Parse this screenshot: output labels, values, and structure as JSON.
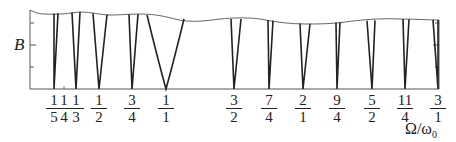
{
  "chart_data": {
    "type": "diagram",
    "title": "",
    "ylabel": "B",
    "xlabel": "Ω/ω₀",
    "y_ticks_count": 3,
    "tongues": [
      {
        "label_num": "1",
        "label_den": "5",
        "value": 0.2,
        "x": 54,
        "left_top": 54,
        "right_top": 58
      },
      {
        "label_num": "1",
        "label_den": "4",
        "value": 0.25,
        "x": 64,
        "left_top": 64,
        "right_top": 64
      },
      {
        "label_num": "1",
        "label_den": "3",
        "value": 0.333,
        "x": 76,
        "left_top": 72,
        "right_top": 80
      },
      {
        "label_num": "1",
        "label_den": "2",
        "value": 0.5,
        "x": 99,
        "left_top": 93,
        "right_top": 107
      },
      {
        "label_num": "3",
        "label_den": "4",
        "value": 0.75,
        "x": 132,
        "left_top": 129,
        "right_top": 138
      },
      {
        "label_num": "1",
        "label_den": "1",
        "value": 1.0,
        "x": 166,
        "left_top": 147,
        "right_top": 184
      },
      {
        "label_num": "3",
        "label_den": "2",
        "value": 1.5,
        "x": 234,
        "left_top": 231,
        "right_top": 241
      },
      {
        "label_num": "7",
        "label_den": "4",
        "value": 1.75,
        "x": 269,
        "left_top": 268,
        "right_top": 273
      },
      {
        "label_num": "2",
        "label_den": "1",
        "value": 2.0,
        "x": 303,
        "left_top": 300,
        "right_top": 310
      },
      {
        "label_num": "9",
        "label_den": "4",
        "value": 2.25,
        "x": 337,
        "left_top": 336,
        "right_top": 340
      },
      {
        "label_num": "5",
        "label_den": "2",
        "value": 2.5,
        "x": 372,
        "left_top": 367,
        "right_top": 375
      },
      {
        "label_num": "11",
        "label_den": "4",
        "value": 2.75,
        "x": 405,
        "left_top": 403,
        "right_top": 409
      },
      {
        "label_num": "3",
        "label_den": "1",
        "value": 3.0,
        "x": 438,
        "left_top": 433,
        "right_top": 438
      }
    ]
  },
  "labels": {
    "y": "B",
    "x_main": "Ω/ω",
    "x_sub": "0"
  }
}
